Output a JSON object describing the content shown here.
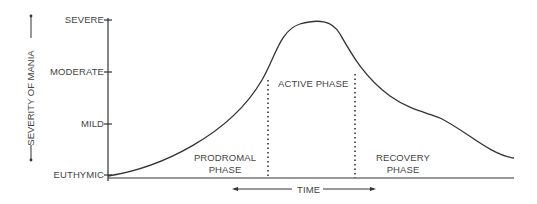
{
  "diagram": {
    "y_axis": {
      "label": "SEVERITY OF MANIA",
      "ticks": [
        "SEVERE",
        "MODERATE",
        "MILD",
        "EUTHYMIC"
      ]
    },
    "x_axis": {
      "label": "TIME"
    },
    "phases": {
      "prodromal": {
        "line1": "PRODROMAL",
        "line2": "PHASE"
      },
      "active": {
        "label": "ACTIVE PHASE"
      },
      "recovery": {
        "line1": "RECOVERY",
        "line2": "PHASE"
      }
    },
    "colors": {
      "line": "#333333",
      "text": "#444444",
      "background": "#ffffff"
    }
  }
}
